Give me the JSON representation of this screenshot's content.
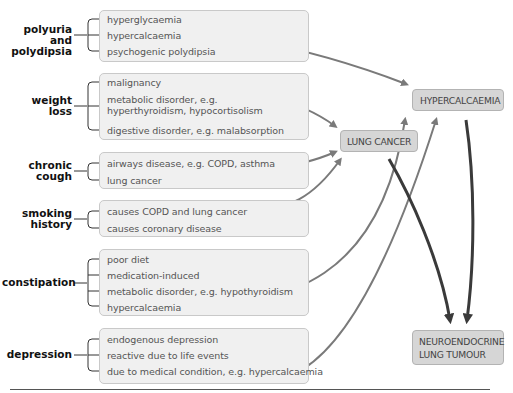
{
  "groups": [
    {
      "symptom": [
        "polyuria and",
        "polydipsia"
      ],
      "causes": [
        "hyperglycaemia",
        "hypercalcaemia",
        "psychogenic polydipsia"
      ]
    },
    {
      "symptom": [
        "weight",
        "loss"
      ],
      "causes": [
        "malignancy",
        "metabolic disorder, e.g.",
        "hyperthyroidism, hypocortisolism",
        "digestive disorder, e.g. malabsorption"
      ]
    },
    {
      "symptom": [
        "chronic",
        "cough"
      ],
      "causes": [
        "airways disease, e.g. COPD, asthma",
        "lung cancer"
      ]
    },
    {
      "symptom": [
        "smoking",
        "history"
      ],
      "causes": [
        "causes COPD and lung cancer",
        "causes coronary disease"
      ]
    },
    {
      "symptom": [
        "constipation"
      ],
      "causes": [
        "poor diet",
        "medication-induced",
        "metabolic disorder, e.g. hypothyroidism",
        "hypercalcaemia"
      ]
    },
    {
      "symptom": [
        "depression"
      ],
      "causes": [
        "endogenous depression",
        "reactive due to life events",
        "due to medical condition, e.g. hypercalcaemia"
      ]
    }
  ],
  "nodes": {
    "hypercalcaemia": "HYPERCALCAEMIA",
    "lung_cancer": "LUNG CANCER",
    "neuroendocrine": [
      "NEUROENDOCRINE",
      "LUNG TUMOUR"
    ]
  },
  "colors": {
    "box_fill": "#f0f0f0",
    "node_fill": "#d6d6d6",
    "light_arrow": "#7a7a7a",
    "dark_arrow": "#3a3a3a"
  }
}
